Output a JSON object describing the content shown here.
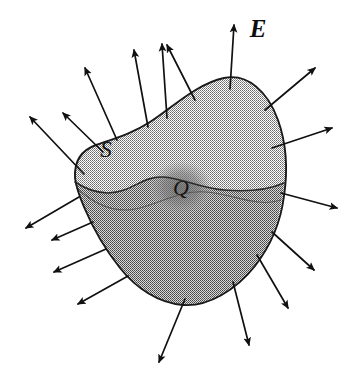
{
  "figure": {
    "domain": "physics-diagram",
    "background_color": "#ffffff",
    "width": 355,
    "height": 380
  },
  "labels": {
    "field_label": "E",
    "surface_label": "S",
    "charge_label": "Q"
  },
  "label_positions": {
    "field": {
      "x": 258,
      "y": 31,
      "font_size": 25
    },
    "surface": {
      "x": 106,
      "y": 152,
      "font_size": 23
    },
    "charge": {
      "x": 181,
      "y": 190,
      "font_size": 22
    }
  },
  "colors": {
    "outline": "#1a1a1a",
    "arrow": "#111111",
    "upper_surface_fill": "#c9c9c9",
    "lower_surface_fill": "#a8a8a8",
    "charge_fill": "#8f8f8f",
    "equator_line": "#3a3a3a",
    "background": "#ffffff"
  },
  "geometry": {
    "surface_outline_path": "M 75,178 C 74,160 82,150 96,145 C 116,138 133,133 150,122 C 172,108 196,84 224,78 C 248,73 268,92 278,120 C 288,148 287,176 284,196 C 281,220 272,244 255,266 C 236,290 208,307 183,305 C 158,303 136,288 120,268 C 104,248 92,226 84,207 C 78,193 76,186 75,178 Z",
    "equator_path": "M 75,182 C 92,193 108,196 124,190 C 138,185 148,176 163,177 C 182,178 199,188 224,190 C 248,192 268,190 284,183",
    "lower_region_path": "M 75,182 C 92,193 108,196 124,190 C 138,185 148,176 163,177 C 182,178 199,188 224,190 C 248,192 268,190 284,183 C 281,214 272,244 255,266 C 236,290 208,307 183,305 C 158,303 136,288 120,268 C 104,248 92,226 84,207 C 78,193 76,186 75,182 Z",
    "inner_curve_path": "M 77,188 C 96,206 117,214 140,208 C 163,202 181,190 206,192 C 233,194 258,208 281,200",
    "charge_blob": {
      "cx": 181,
      "cy": 188,
      "rx": 31,
      "ry": 27
    }
  },
  "field_arrows": [
    {
      "name": "arrow-up-left-far",
      "x1": 103,
      "y1": 152,
      "x2": 63,
      "y2": 113
    },
    {
      "name": "arrow-up-left-outer",
      "x1": 117,
      "y1": 140,
      "x2": 85,
      "y2": 68
    },
    {
      "name": "arrow-up-left-mid",
      "x1": 148,
      "y1": 127,
      "x2": 134,
      "y2": 50
    },
    {
      "name": "arrow-up-mid",
      "x1": 167,
      "y1": 118,
      "x2": 162,
      "y2": 44
    },
    {
      "name": "arrow-up-right-mid",
      "x1": 195,
      "y1": 100,
      "x2": 167,
      "y2": 45
    },
    {
      "name": "arrow-up-e-labeled",
      "x1": 230,
      "y1": 89,
      "x2": 234,
      "y2": 25
    },
    {
      "name": "arrow-up-right",
      "x1": 265,
      "y1": 110,
      "x2": 315,
      "y2": 68
    },
    {
      "name": "arrow-right",
      "x1": 272,
      "y1": 148,
      "x2": 332,
      "y2": 128
    },
    {
      "name": "arrow-right-lower",
      "x1": 281,
      "y1": 193,
      "x2": 337,
      "y2": 208
    },
    {
      "name": "arrow-down-right-1",
      "x1": 272,
      "y1": 232,
      "x2": 314,
      "y2": 270
    },
    {
      "name": "arrow-down-right-2",
      "x1": 257,
      "y1": 255,
      "x2": 288,
      "y2": 308
    },
    {
      "name": "arrow-down-right-3",
      "x1": 233,
      "y1": 282,
      "x2": 249,
      "y2": 345
    },
    {
      "name": "arrow-down",
      "x1": 185,
      "y1": 299,
      "x2": 159,
      "y2": 362
    },
    {
      "name": "arrow-down-left-1",
      "x1": 128,
      "y1": 276,
      "x2": 78,
      "y2": 304
    },
    {
      "name": "arrow-down-left-2",
      "x1": 106,
      "y1": 249,
      "x2": 54,
      "y2": 272
    },
    {
      "name": "arrow-down-left-3",
      "x1": 93,
      "y1": 222,
      "x2": 52,
      "y2": 240
    },
    {
      "name": "arrow-left-lower",
      "x1": 79,
      "y1": 197,
      "x2": 26,
      "y2": 228
    },
    {
      "name": "arrow-left-upper",
      "x1": 84,
      "y1": 174,
      "x2": 30,
      "y2": 117
    }
  ]
}
